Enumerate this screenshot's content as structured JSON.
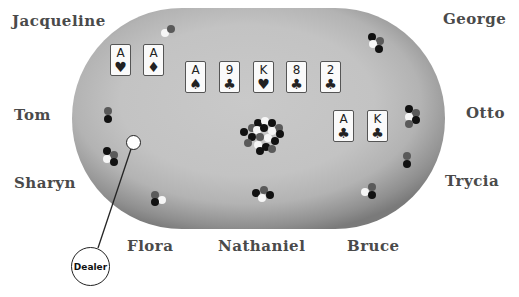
{
  "players": [
    {
      "name": "Jacqueline",
      "x": 12,
      "y": 12
    },
    {
      "name": "George",
      "x": 443,
      "y": 10
    },
    {
      "name": "Tom",
      "x": 14,
      "y": 106
    },
    {
      "name": "Otto",
      "x": 466,
      "y": 104
    },
    {
      "name": "Sharyn",
      "x": 14,
      "y": 174
    },
    {
      "name": "Trycia",
      "x": 445,
      "y": 172
    },
    {
      "name": "Flora",
      "x": 127,
      "y": 237
    },
    {
      "name": "Nathaniel",
      "x": 218,
      "y": 237
    },
    {
      "name": "Bruce",
      "x": 347,
      "y": 237
    }
  ],
  "hole_cards_left": [
    {
      "rank": "A",
      "suit": "♥",
      "suit_name": "hearts"
    },
    {
      "rank": "A",
      "suit": "♦",
      "suit_name": "diamonds"
    }
  ],
  "community_cards": [
    {
      "rank": "A",
      "suit": "♠",
      "suit_name": "spades"
    },
    {
      "rank": "9",
      "suit": "♣",
      "suit_name": "clubs"
    },
    {
      "rank": "K",
      "suit": "♥",
      "suit_name": "hearts"
    },
    {
      "rank": "8",
      "suit": "♣",
      "suit_name": "clubs"
    },
    {
      "rank": "2",
      "suit": "♣",
      "suit_name": "clubs"
    }
  ],
  "hole_cards_right": [
    {
      "rank": "A",
      "suit": "♣",
      "suit_name": "clubs"
    },
    {
      "rank": "K",
      "suit": "♣",
      "suit_name": "clubs"
    }
  ],
  "dealer": {
    "label": "Dealer"
  },
  "colors": {
    "table": "#c3c3c3",
    "table_edge": "#7a7a7a",
    "name_text": "#4a4a4a",
    "chip_black": "#111111",
    "chip_gray": "#5a5a5a",
    "chip_white": "#f6f6f6"
  }
}
